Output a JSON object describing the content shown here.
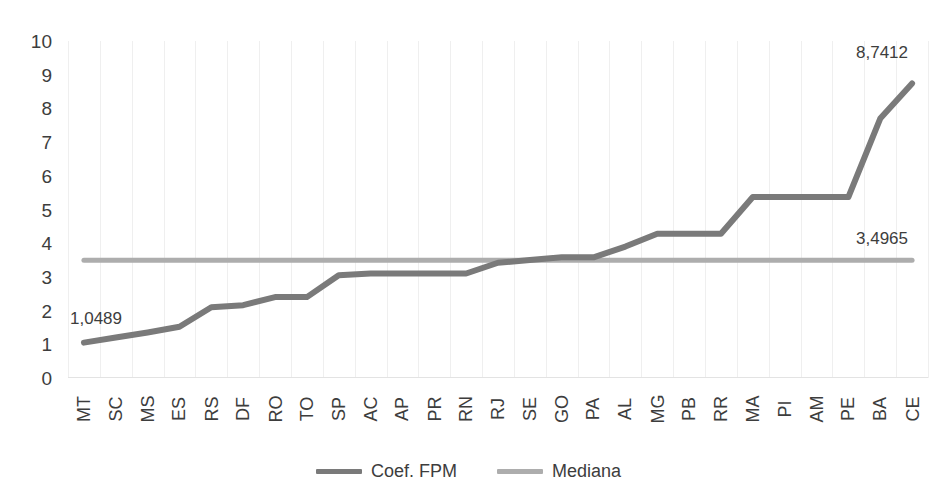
{
  "chart_data": {
    "type": "line",
    "title": "",
    "xlabel": "",
    "ylabel": "",
    "ylim": [
      0,
      10
    ],
    "ytick_labels": [
      "10",
      "9",
      "8",
      "7",
      "6",
      "5",
      "4",
      "3",
      "2",
      "1",
      "0"
    ],
    "yticks": [
      10,
      9,
      8,
      7,
      6,
      5,
      4,
      3,
      2,
      1,
      0
    ],
    "grid": "vertical-only",
    "legend_position": "bottom-center",
    "categories": [
      "MT",
      "SC",
      "MS",
      "ES",
      "RS",
      "DF",
      "RO",
      "TO",
      "SP",
      "AC",
      "AP",
      "PR",
      "RN",
      "RJ",
      "SE",
      "GO",
      "PA",
      "AL",
      "MG",
      "PB",
      "RR",
      "MA",
      "PI",
      "AM",
      "PE",
      "BA",
      "CE"
    ],
    "series": [
      {
        "name": "Coef. FPM",
        "color": "#7a7a7a",
        "values": [
          1.0489,
          1.2,
          1.35,
          1.52,
          2.1,
          2.16,
          2.4,
          2.4,
          3.05,
          3.1,
          3.1,
          3.1,
          3.1,
          3.42,
          3.5,
          3.58,
          3.58,
          3.9,
          4.28,
          4.28,
          4.28,
          5.37,
          5.37,
          5.37,
          5.37,
          7.7,
          8.7412
        ]
      },
      {
        "name": "Mediana",
        "color": "#adadad",
        "values": [
          3.4965,
          3.4965,
          3.4965,
          3.4965,
          3.4965,
          3.4965,
          3.4965,
          3.4965,
          3.4965,
          3.4965,
          3.4965,
          3.4965,
          3.4965,
          3.4965,
          3.4965,
          3.4965,
          3.4965,
          3.4965,
          3.4965,
          3.4965,
          3.4965,
          3.4965,
          3.4965,
          3.4965,
          3.4965,
          3.4965,
          3.4965
        ]
      }
    ],
    "annotations": [
      {
        "id": "first-value",
        "text": "1,0489",
        "category": "MT",
        "value": 1.0489
      },
      {
        "id": "last-value",
        "text": "8,7412",
        "category": "CE",
        "value": 8.7412
      },
      {
        "id": "median-value",
        "text": "3,4965",
        "category": "CE",
        "value": 3.4965
      }
    ]
  },
  "legend": {
    "items": [
      {
        "label": "Coef. FPM",
        "color": "#7a7a7a"
      },
      {
        "label": "Mediana",
        "color": "#adadad"
      }
    ]
  },
  "colors": {
    "series_coef": "#7a7a7a",
    "series_median": "#adadad",
    "text": "#3d3d3d",
    "gridline": "#efefef",
    "background": "#ffffff"
  }
}
